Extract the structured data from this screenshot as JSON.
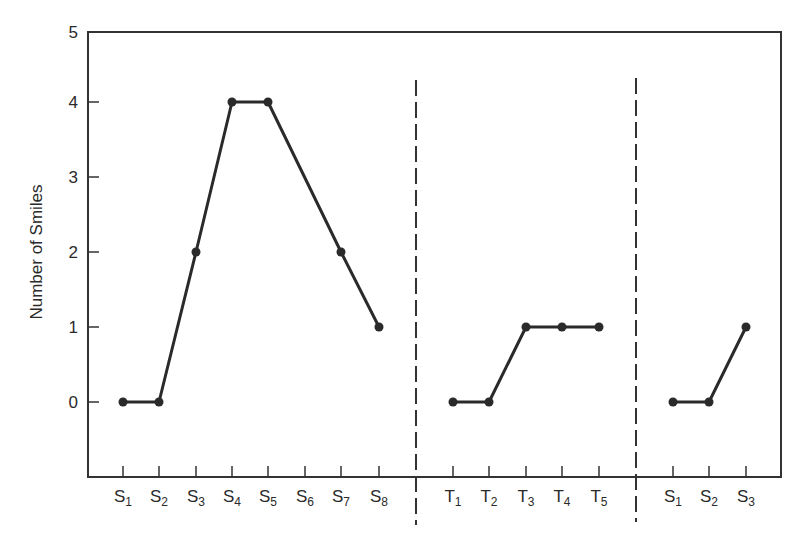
{
  "chart_data": {
    "type": "line",
    "title": "",
    "xlabel": "",
    "ylabel": "Number of Smiles",
    "ylim": [
      -1,
      5
    ],
    "yticks": [
      0,
      1,
      2,
      3,
      4,
      5
    ],
    "grid": false,
    "legend": null,
    "phase_dividers": "dashed vertical lines separating three phases",
    "phases": [
      {
        "name": "phase-1-S",
        "categories": [
          "S1",
          "S2",
          "S3",
          "S4",
          "S5",
          "S6",
          "S7",
          "S8"
        ],
        "points": [
          {
            "x": "S1",
            "y": 0
          },
          {
            "x": "S2",
            "y": 0
          },
          {
            "x": "S3",
            "y": 2
          },
          {
            "x": "S4",
            "y": 4
          },
          {
            "x": "S5",
            "y": 4
          },
          {
            "x": "S7",
            "y": 2
          },
          {
            "x": "S8",
            "y": 1
          }
        ]
      },
      {
        "name": "phase-2-T",
        "categories": [
          "T1",
          "T2",
          "T3",
          "T4",
          "T5"
        ],
        "points": [
          {
            "x": "T1",
            "y": 0
          },
          {
            "x": "T2",
            "y": 0
          },
          {
            "x": "T3",
            "y": 1
          },
          {
            "x": "T4",
            "y": 1
          },
          {
            "x": "T5",
            "y": 1
          }
        ]
      },
      {
        "name": "phase-3-S",
        "categories": [
          "S1",
          "S2",
          "S3"
        ],
        "points": [
          {
            "x": "S1",
            "y": 0
          },
          {
            "x": "S2",
            "y": 0
          },
          {
            "x": "S3",
            "y": 1
          }
        ]
      }
    ]
  },
  "axis": {
    "ylabel": "Number of Smiles",
    "ytick_labels": [
      "0",
      "1",
      "2",
      "3",
      "4",
      "5"
    ]
  },
  "xticks": [
    {
      "base": "S",
      "sub": "1"
    },
    {
      "base": "S",
      "sub": "2"
    },
    {
      "base": "S",
      "sub": "3"
    },
    {
      "base": "S",
      "sub": "4"
    },
    {
      "base": "S",
      "sub": "5"
    },
    {
      "base": "S",
      "sub": "6"
    },
    {
      "base": "S",
      "sub": "7"
    },
    {
      "base": "S",
      "sub": "8"
    },
    {
      "base": "T",
      "sub": "1"
    },
    {
      "base": "T",
      "sub": "2"
    },
    {
      "base": "T",
      "sub": "3"
    },
    {
      "base": "T",
      "sub": "4"
    },
    {
      "base": "T",
      "sub": "5"
    },
    {
      "base": "S",
      "sub": "1"
    },
    {
      "base": "S",
      "sub": "2"
    },
    {
      "base": "S",
      "sub": "3"
    }
  ],
  "colors": {
    "line": "#2a2a2a",
    "axis": "#333333",
    "background": "#ffffff"
  }
}
